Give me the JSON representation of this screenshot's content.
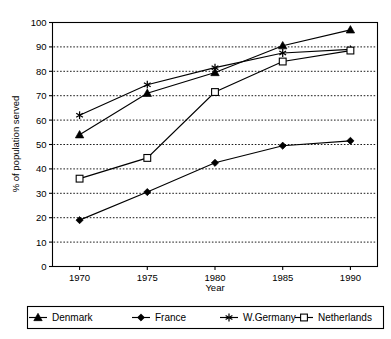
{
  "chart_data": {
    "type": "line",
    "title": "",
    "xlabel": "Year",
    "ylabel": "% of population served",
    "categories": [
      "1970",
      "1975",
      "1980",
      "1985",
      "1990"
    ],
    "x": [
      1970,
      1975,
      1980,
      1985,
      1990
    ],
    "xlim": [
      1968,
      1992
    ],
    "ylim": [
      0,
      100
    ],
    "y_ticks": [
      0,
      10,
      20,
      30,
      40,
      50,
      60,
      70,
      80,
      90,
      100
    ],
    "y_tick_labels": [
      "0",
      "10",
      "20",
      "30",
      "40",
      "50",
      "60",
      "70",
      "80",
      "90",
      "100"
    ],
    "grid": true,
    "grid_style": "dotted-horizontal",
    "legend_position": "bottom",
    "colors": {
      "line": "#000000",
      "background": "#ffffff",
      "grid": "#000000"
    },
    "series": [
      {
        "name": "Denmark",
        "marker": "filled-triangle",
        "values": [
          54,
          71,
          79.5,
          90.5,
          97
        ]
      },
      {
        "name": "France",
        "marker": "filled-diamond",
        "values": [
          19,
          30.5,
          42.5,
          49.5,
          51.5
        ]
      },
      {
        "name": "W.Germany",
        "marker": "star",
        "values": [
          62,
          74.5,
          81.5,
          87.5,
          89
        ]
      },
      {
        "name": "Netherlands",
        "marker": "open-square",
        "values": [
          36,
          44.5,
          71.5,
          84,
          88.5
        ]
      }
    ]
  },
  "legend": {
    "items": [
      {
        "label": "Denmark",
        "marker": "filled-triangle"
      },
      {
        "label": "France",
        "marker": "filled-diamond"
      },
      {
        "label": "W.Germany",
        "marker": "star"
      },
      {
        "label": "Netherlands",
        "marker": "open-square"
      }
    ]
  }
}
